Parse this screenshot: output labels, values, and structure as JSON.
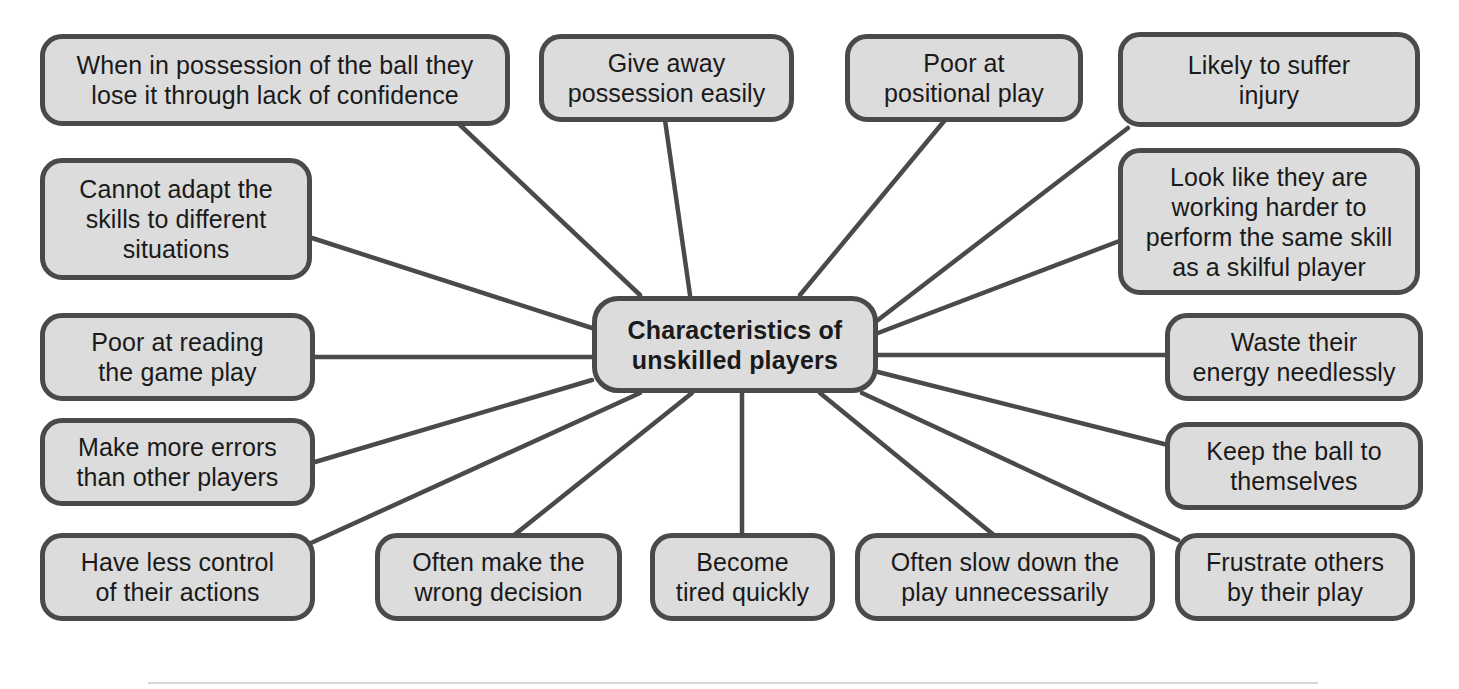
{
  "diagram": {
    "type": "mind-map",
    "title": "Characteristics of unskilled players",
    "colors": {
      "node_fill": "#dcdcdc",
      "node_border": "#4a4a4a",
      "connector": "#4a4a4a",
      "text": "#1a1a1a",
      "background": "#ffffff"
    },
    "center": {
      "id": "center",
      "label": "Characteristics of\nunskilled players",
      "line1": "Characteristics of",
      "line2": "unskilled players"
    },
    "nodes": [
      {
        "id": "lose-possession-confidence",
        "label": "When in possession of the ball they\nlose it through lack of confidence",
        "position": "top-left"
      },
      {
        "id": "give-away-possession",
        "label": "Give away\npossession easily",
        "position": "top-center-left"
      },
      {
        "id": "poor-positional-play",
        "label": "Poor at\npositional play",
        "position": "top-center-right"
      },
      {
        "id": "likely-suffer-injury",
        "label": "Likely to suffer\ninjury",
        "position": "top-right"
      },
      {
        "id": "working-harder",
        "label": "Look like they are\nworking harder to\nperform the same skill\nas a skilful player",
        "position": "right-upper"
      },
      {
        "id": "waste-energy",
        "label": "Waste their\nenergy needlessly",
        "position": "right-middle"
      },
      {
        "id": "keep-ball-to-themselves",
        "label": "Keep the ball to\nthemselves",
        "position": "right-lower"
      },
      {
        "id": "frustrate-others",
        "label": "Frustrate others\nby their play",
        "position": "bottom-right"
      },
      {
        "id": "slow-down-play",
        "label": "Often slow down the\nplay unnecessarily",
        "position": "bottom-center-right"
      },
      {
        "id": "become-tired",
        "label": "Become\ntired quickly",
        "position": "bottom-center"
      },
      {
        "id": "wrong-decision",
        "label": "Often make the\nwrong decision",
        "position": "bottom-center-left"
      },
      {
        "id": "less-control",
        "label": "Have less control\nof their actions",
        "position": "bottom-left"
      },
      {
        "id": "make-more-errors",
        "label": "Make more errors\nthan other players",
        "position": "left-lower"
      },
      {
        "id": "poor-reading-game",
        "label": "Poor at reading\nthe game play",
        "position": "left-middle"
      },
      {
        "id": "cannot-adapt-skills",
        "label": "Cannot adapt the\nskills to different\nsituations",
        "position": "left-upper"
      }
    ]
  }
}
